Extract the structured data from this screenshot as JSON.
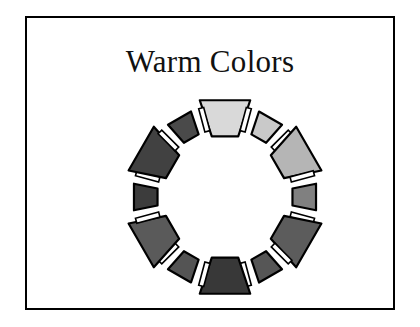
{
  "document": {
    "title": "Warm Colors",
    "background_color": "#ffffff",
    "frame_color": "#000000"
  },
  "chart_data": {
    "type": "pie",
    "title": "Warm Colors",
    "subtitle": "",
    "xlabel": "",
    "ylabel": "",
    "legend_position": "none",
    "grid": false,
    "segment_count": 12,
    "categories": [
      "swatch-1-top",
      "swatch-2-upper-right-small",
      "swatch-3-right-upper-large",
      "swatch-4-right-small",
      "swatch-5-lower-right-large",
      "swatch-6-bottom-right-small",
      "swatch-7-bottom",
      "swatch-8-bottom-left-small",
      "swatch-9-lower-left-large",
      "swatch-10-left-small",
      "swatch-11-upper-left-large",
      "swatch-12-top-left-small"
    ],
    "values": [
      30,
      30,
      30,
      30,
      30,
      30,
      30,
      30,
      30,
      30,
      30,
      30
    ],
    "colors": [
      "#d9d9d9",
      "#c9c9c9",
      "#b5b5b5",
      "#808080",
      "#5c5c5c",
      "#565656",
      "#383838",
      "#545454",
      "#5a5a5a",
      "#3c3c3c",
      "#414141",
      "#4a4a4a"
    ],
    "segments": [
      {
        "name": "swatch-1-top",
        "angle_deg": 270,
        "size": "large",
        "fill": "#d9d9d9"
      },
      {
        "name": "swatch-2-upper-right-small",
        "angle_deg": 300,
        "size": "small",
        "fill": "#c9c9c9"
      },
      {
        "name": "swatch-3-right-upper-large",
        "angle_deg": 330,
        "size": "large",
        "fill": "#b5b5b5"
      },
      {
        "name": "swatch-4-right-small",
        "angle_deg": 0,
        "size": "small",
        "fill": "#808080"
      },
      {
        "name": "swatch-5-lower-right-large",
        "angle_deg": 30,
        "size": "large",
        "fill": "#5c5c5c"
      },
      {
        "name": "swatch-6-bottom-right-small",
        "angle_deg": 60,
        "size": "small",
        "fill": "#565656"
      },
      {
        "name": "swatch-7-bottom",
        "angle_deg": 90,
        "size": "large",
        "fill": "#383838"
      },
      {
        "name": "swatch-8-bottom-left-small",
        "angle_deg": 120,
        "size": "small",
        "fill": "#545454"
      },
      {
        "name": "swatch-9-lower-left-large",
        "angle_deg": 150,
        "size": "large",
        "fill": "#5a5a5a"
      },
      {
        "name": "swatch-10-left-small",
        "angle_deg": 180,
        "size": "small",
        "fill": "#3c3c3c"
      },
      {
        "name": "swatch-11-upper-left-large",
        "angle_deg": 210,
        "size": "large",
        "fill": "#414141"
      },
      {
        "name": "swatch-12-top-left-small",
        "angle_deg": 240,
        "size": "small",
        "fill": "#4a4a4a"
      }
    ]
  }
}
